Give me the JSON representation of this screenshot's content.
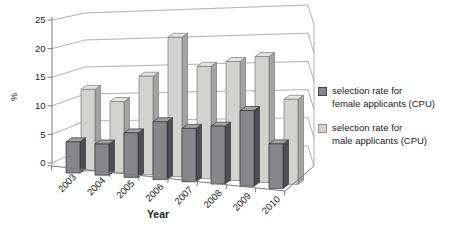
{
  "chart_data": {
    "type": "bar",
    "variant": "3d-clustered-column",
    "title": "",
    "xlabel": "Year",
    "ylabel": "%",
    "categories": [
      "2003",
      "2004",
      "2005",
      "2006",
      "2007",
      "2008",
      "2009",
      "2010"
    ],
    "series": [
      {
        "name": "selection rate for female applicants (CPU)",
        "color": "#87878a",
        "values": [
          3.5,
          3.5,
          5,
          6.5,
          6,
          6.5,
          8.5,
          5
        ]
      },
      {
        "name": "selection rate for male applicants (CPU)",
        "color": "#d2d2d0",
        "values": [
          12,
          10.5,
          14.5,
          20.5,
          16.5,
          17.5,
          18.5,
          12.5
        ]
      }
    ],
    "ylim": [
      0,
      25
    ],
    "yticks": [
      0,
      5,
      10,
      15,
      20,
      25
    ],
    "grid": true,
    "legend_position": "right"
  },
  "legend": {
    "entries": [
      {
        "line1": "selection rate for",
        "line2": "female applicants (CPU)",
        "swatch_color": "#87878a",
        "swatch_border": "#46464a"
      },
      {
        "line1": "selection rate for",
        "line2": "male applicants (CPU)",
        "swatch_color": "#d2d2d0",
        "swatch_border": "#8f8f8d"
      }
    ]
  },
  "colors": {
    "female_front": "#87878a",
    "female_side": "#4e4e52",
    "female_top": "#a2a2a5",
    "female_outline": "#353539",
    "male_front": "#d2d2d0",
    "male_side": "#a3a3a1",
    "male_top": "#e4e4e2",
    "male_outline": "#78787c",
    "gridline": "#a8a8a8",
    "axis": "#7b7b7b",
    "text": "#1c1c1c",
    "background": "#ffffff"
  }
}
